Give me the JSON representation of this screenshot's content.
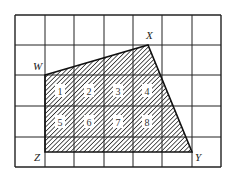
{
  "diagram": {
    "type": "grid-polygon-area",
    "grid": {
      "columns": 7,
      "rows": 5,
      "x_lines": [
        15,
        45,
        74,
        104,
        133,
        162,
        192,
        221
      ],
      "y_lines": [
        15,
        45,
        75,
        106,
        137,
        167
      ],
      "line_color": "#222222"
    },
    "polygon": {
      "fill_pattern": "diagonal-hatch",
      "stroke_color": "#111111",
      "vertices": [
        {
          "name": "W",
          "x": 45,
          "y": 75,
          "label_x": 33,
          "label_y": 70
        },
        {
          "name": "X",
          "x": 148,
          "y": 45,
          "label_x": 146,
          "label_y": 39
        },
        {
          "name": "Y",
          "x": 192,
          "y": 152,
          "label_x": 195,
          "label_y": 161
        },
        {
          "name": "Z",
          "x": 45,
          "y": 152,
          "label_x": 34,
          "label_y": 161
        }
      ]
    },
    "numbered_squares": [
      {
        "label": "1",
        "cx": 60,
        "cy": 91
      },
      {
        "label": "2",
        "cx": 89,
        "cy": 91
      },
      {
        "label": "3",
        "cx": 118,
        "cy": 91
      },
      {
        "label": "4",
        "cx": 147,
        "cy": 91
      },
      {
        "label": "5",
        "cx": 60,
        "cy": 122
      },
      {
        "label": "6",
        "cx": 89,
        "cy": 122
      },
      {
        "label": "7",
        "cx": 118,
        "cy": 122
      },
      {
        "label": "8",
        "cx": 147,
        "cy": 122
      }
    ]
  }
}
